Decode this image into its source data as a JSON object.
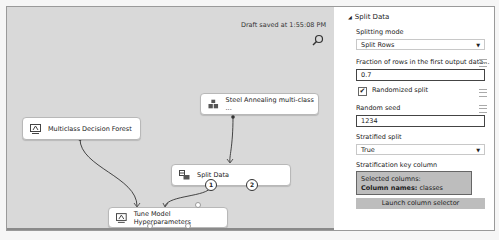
{
  "canvas": {
    "draft_status": "Draft saved at 1:55:08 PM",
    "nodes": [
      {
        "id": "steel",
        "label": "Steel Annealing multi-class ...",
        "icon": "dataset-icon"
      },
      {
        "id": "forest",
        "label": "Multiclass Decision Forest",
        "icon": "model-icon"
      },
      {
        "id": "split",
        "label": "Split Data",
        "icon": "split-icon",
        "ports": [
          "1",
          "2"
        ]
      },
      {
        "id": "tune",
        "label": "Tune Model Hyperparameters",
        "icon": "model-icon"
      }
    ]
  },
  "panel": {
    "section_title": "Split Data",
    "splitting_mode": {
      "label": "Splitting mode",
      "value": "Split Rows"
    },
    "fraction": {
      "label": "Fraction of rows in the first output data...",
      "value": "0.7"
    },
    "randomized": {
      "label": "Randomized split",
      "checked": true,
      "check_glyph": "✔"
    },
    "seed": {
      "label": "Random seed",
      "value": "1234"
    },
    "stratified": {
      "label": "Stratified split",
      "value": "True"
    },
    "strat_key": {
      "label": "Stratification key column",
      "selected_line1": "Selected columns:",
      "selected_line2_bold": "Column names:",
      "selected_line2_value": " classes"
    },
    "launch_button": "Launch column selector"
  },
  "colors": {
    "canvas_bg": "#d9d9d9",
    "button_bg": "#bdbdbd",
    "scrollbar": "#8f8f8f"
  }
}
